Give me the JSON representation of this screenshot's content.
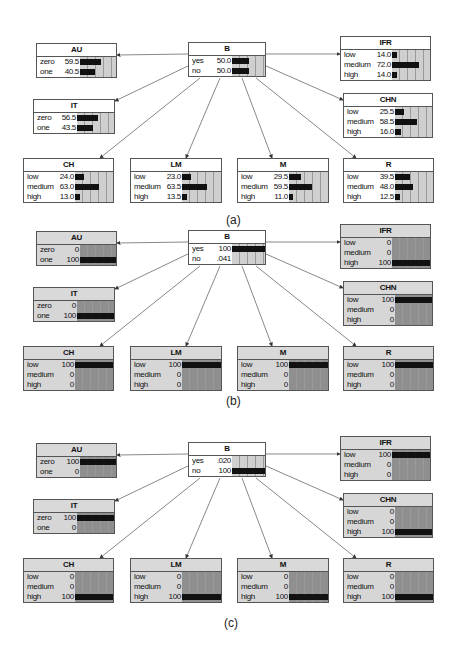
{
  "panels": [
    {
      "label": "(a)",
      "nodes": {
        "AU": {
          "title": "AU",
          "states": [
            "zero",
            "one"
          ],
          "values": [
            "59.5",
            "40.5"
          ],
          "pct": [
            59.5,
            40.5
          ]
        },
        "B": {
          "title": "B",
          "states": [
            "yes",
            "no"
          ],
          "values": [
            "50.0",
            "50.0"
          ],
          "pct": [
            50,
            50
          ]
        },
        "IFR": {
          "title": "IFR",
          "states": [
            "low",
            "medium",
            "high"
          ],
          "values": [
            "14.0",
            "72.0",
            "14.0"
          ],
          "pct": [
            14,
            72,
            14
          ]
        },
        "IT": {
          "title": "IT",
          "states": [
            "zero",
            "one"
          ],
          "values": [
            "56.5",
            "43.5"
          ],
          "pct": [
            56.5,
            43.5
          ]
        },
        "CHN": {
          "title": "CHN",
          "states": [
            "low",
            "medium",
            "high"
          ],
          "values": [
            "25.5",
            "58.5",
            "16.0"
          ],
          "pct": [
            25.5,
            58.5,
            16
          ]
        },
        "CH": {
          "title": "CH",
          "states": [
            "low",
            "medium",
            "high"
          ],
          "values": [
            "24.0",
            "63.0",
            "13.0"
          ],
          "pct": [
            24,
            63,
            13
          ]
        },
        "LM": {
          "title": "LM",
          "states": [
            "low",
            "medium",
            "high"
          ],
          "values": [
            "23.0",
            "63.5",
            "13.5"
          ],
          "pct": [
            23,
            63.5,
            13.5
          ]
        },
        "M": {
          "title": "M",
          "states": [
            "low",
            "medium",
            "high"
          ],
          "values": [
            "29.5",
            "59.5",
            "11.0"
          ],
          "pct": [
            29.5,
            59.5,
            11
          ]
        },
        "R": {
          "title": "R",
          "states": [
            "low",
            "medium",
            "high"
          ],
          "values": [
            "39.5",
            "48.0",
            "12.5"
          ],
          "pct": [
            39.5,
            48,
            12.5
          ]
        }
      }
    },
    {
      "label": "(b)",
      "nodes": {
        "AU": {
          "title": "AU",
          "states": [
            "zero",
            "one"
          ],
          "values": [
            "0",
            "100"
          ],
          "pct": [
            0,
            100
          ]
        },
        "B": {
          "title": "B",
          "states": [
            "yes",
            "no"
          ],
          "values": [
            "100",
            ".041"
          ],
          "pct": [
            100,
            0
          ]
        },
        "IFR": {
          "title": "IFR",
          "states": [
            "low",
            "medium",
            "high"
          ],
          "values": [
            "0",
            "0",
            "100"
          ],
          "pct": [
            0,
            0,
            100
          ]
        },
        "IT": {
          "title": "IT",
          "states": [
            "zero",
            "one"
          ],
          "values": [
            "0",
            "100"
          ],
          "pct": [
            0,
            100
          ]
        },
        "CHN": {
          "title": "CHN",
          "states": [
            "low",
            "medium",
            "high"
          ],
          "values": [
            "100",
            "0",
            "0"
          ],
          "pct": [
            100,
            0,
            0
          ]
        },
        "CH": {
          "title": "CH",
          "states": [
            "low",
            "medium",
            "high"
          ],
          "values": [
            "100",
            "0",
            "0"
          ],
          "pct": [
            100,
            0,
            0
          ]
        },
        "LM": {
          "title": "LM",
          "states": [
            "low",
            "medium",
            "high"
          ],
          "values": [
            "100",
            "0",
            "0"
          ],
          "pct": [
            100,
            0,
            0
          ]
        },
        "M": {
          "title": "M",
          "states": [
            "low",
            "medium",
            "high"
          ],
          "values": [
            "100",
            "0",
            "0"
          ],
          "pct": [
            100,
            0,
            0
          ]
        },
        "R": {
          "title": "R",
          "states": [
            "low",
            "medium",
            "high"
          ],
          "values": [
            "100",
            "0",
            "0"
          ],
          "pct": [
            100,
            0,
            0
          ]
        }
      }
    },
    {
      "label": "(c)",
      "nodes": {
        "AU": {
          "title": "AU",
          "states": [
            "zero",
            "one"
          ],
          "values": [
            "100",
            "0"
          ],
          "pct": [
            100,
            0
          ]
        },
        "B": {
          "title": "B",
          "states": [
            "yes",
            "no"
          ],
          "values": [
            ".020",
            "100"
          ],
          "pct": [
            0,
            100
          ]
        },
        "IFR": {
          "title": "IFR",
          "states": [
            "low",
            "medium",
            "high"
          ],
          "values": [
            "100",
            "0",
            "0"
          ],
          "pct": [
            100,
            0,
            0
          ]
        },
        "IT": {
          "title": "IT",
          "states": [
            "zero",
            "one"
          ],
          "values": [
            "100",
            "0"
          ],
          "pct": [
            100,
            0
          ]
        },
        "CHN": {
          "title": "CHN",
          "states": [
            "low",
            "medium",
            "high"
          ],
          "values": [
            "0",
            "0",
            "100"
          ],
          "pct": [
            0,
            0,
            100
          ]
        },
        "CH": {
          "title": "CH",
          "states": [
            "low",
            "medium",
            "high"
          ],
          "values": [
            "0",
            "0",
            "100"
          ],
          "pct": [
            0,
            0,
            100
          ]
        },
        "LM": {
          "title": "LM",
          "states": [
            "low",
            "medium",
            "high"
          ],
          "values": [
            "0",
            "0",
            "100"
          ],
          "pct": [
            0,
            0,
            100
          ]
        },
        "M": {
          "title": "M",
          "states": [
            "low",
            "medium",
            "high"
          ],
          "values": [
            "0",
            "0",
            "100"
          ],
          "pct": [
            0,
            0,
            100
          ]
        },
        "R": {
          "title": "R",
          "states": [
            "low",
            "medium",
            "high"
          ],
          "values": [
            "0",
            "0",
            "100"
          ],
          "pct": [
            0,
            0,
            100
          ]
        }
      }
    }
  ],
  "colors": {
    "bar": "#111111",
    "bar_bg": "#cfcfcf",
    "evidence_bg": "#8f8f8f",
    "border": "#555555"
  }
}
